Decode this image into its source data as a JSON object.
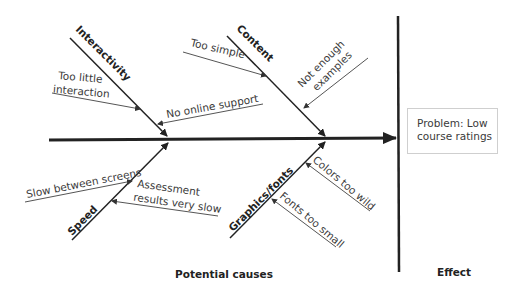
{
  "diagram": {
    "type": "fishbone",
    "effect": {
      "label": "Effect",
      "problem_line1": "Problem: Low",
      "problem_line2": "course ratings"
    },
    "causes_label": "Potential causes",
    "categories": [
      {
        "name": "Interactivity",
        "position": "top-left",
        "causes": [
          {
            "line1": "Too little",
            "line2": "interaction"
          },
          {
            "line1": "No online support"
          }
        ]
      },
      {
        "name": "Content",
        "position": "top-right",
        "causes": [
          {
            "line1": "Too simple"
          },
          {
            "line1": "Not enough",
            "line2": "examples"
          }
        ]
      },
      {
        "name": "Speed",
        "position": "bottom-left",
        "causes": [
          {
            "line1": "Slow between screens"
          },
          {
            "line1": "Assessment",
            "line2": "results very slow"
          }
        ]
      },
      {
        "name": "Graphics/fonts",
        "position": "bottom-right",
        "causes": [
          {
            "line1": "Colors too wild"
          },
          {
            "line1": "Fonts too small"
          }
        ]
      }
    ],
    "colors": {
      "line": "#222222",
      "sub_line": "#555555",
      "text": "#3a3a3a",
      "box_border": "#cfcfcf"
    }
  }
}
